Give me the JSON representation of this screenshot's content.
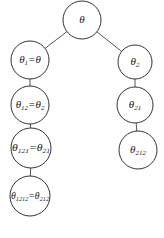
{
  "diagram": {
    "type": "tree",
    "nodes": [
      {
        "id": "root",
        "cx": 82,
        "cy": 20,
        "r": 19,
        "label": {
          "sym": "θ",
          "sub": "",
          "eq": "",
          "eqsym": "",
          "eqsub": ""
        }
      },
      {
        "id": "n1",
        "cx": 30,
        "cy": 60,
        "r": 19,
        "label": {
          "sym": "θ",
          "sub": "1",
          "eq": "=",
          "eqsym": "θ",
          "eqsub": ""
        }
      },
      {
        "id": "n2",
        "cx": 135,
        "cy": 62,
        "r": 17,
        "label": {
          "sym": "θ",
          "sub": "2",
          "eq": "",
          "eqsym": "",
          "eqsub": ""
        }
      },
      {
        "id": "n12",
        "cx": 30,
        "cy": 105,
        "r": 19,
        "label": {
          "sym": "θ",
          "sub": "12",
          "eq": "=",
          "eqsym": "θ",
          "eqsub": "2"
        }
      },
      {
        "id": "n21",
        "cx": 135,
        "cy": 105,
        "r": 18,
        "label": {
          "sym": "θ",
          "sub": "21",
          "eq": "",
          "eqsym": "",
          "eqsub": ""
        }
      },
      {
        "id": "n121",
        "cx": 31,
        "cy": 148,
        "r": 20,
        "label": {
          "sym": "θ",
          "sub": "121",
          "eq": "=",
          "eqsym": "θ",
          "eqsub": "21"
        }
      },
      {
        "id": "n212",
        "cx": 138,
        "cy": 150,
        "r": 19,
        "label": {
          "sym": "θ",
          "sub": "212",
          "eq": "",
          "eqsym": "",
          "eqsub": ""
        }
      },
      {
        "id": "n1212",
        "cx": 30,
        "cy": 196,
        "r": 20,
        "label": {
          "sym": "θ",
          "sub": "1212",
          "eq": "=",
          "eqsym": "θ",
          "eqsub": "212"
        }
      }
    ],
    "edges": [
      {
        "from": "root",
        "to": "n1"
      },
      {
        "from": "root",
        "to": "n2"
      },
      {
        "from": "n1",
        "to": "n12"
      },
      {
        "from": "n12",
        "to": "n121"
      },
      {
        "from": "n121",
        "to": "n1212"
      },
      {
        "from": "n2",
        "to": "n21"
      },
      {
        "from": "n21",
        "to": "n212"
      }
    ],
    "colors": {
      "stroke": "#333333",
      "edge": "#555555",
      "text": "#222222",
      "background": "#ffffff"
    }
  }
}
